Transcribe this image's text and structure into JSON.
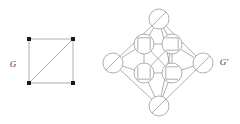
{
  "figure": {
    "kind": "graph-diagram",
    "width": 240,
    "height": 124,
    "background": "#ffffff",
    "edge_color": "#8c8c8c",
    "node_outline_color": "#8c8c8c",
    "node_fill": "#ffffff",
    "vertex_marker_color": "#1a1a1a",
    "label_color": "#3a3a3a"
  },
  "graphs": [
    {
      "id": "G",
      "label": "G",
      "label_position": "left",
      "label_point": {
        "x": 13,
        "y": 65
      },
      "node_style": "filled-square-marker",
      "marker_size": 4,
      "vertices": [
        {
          "id": "a",
          "x": 29,
          "y": 39
        },
        {
          "id": "b",
          "x": 73,
          "y": 39
        },
        {
          "id": "c",
          "x": 29,
          "y": 83
        },
        {
          "id": "d",
          "x": 73,
          "y": 83
        }
      ],
      "edges": [
        {
          "from": "a",
          "to": "b"
        },
        {
          "from": "b",
          "to": "d"
        },
        {
          "from": "d",
          "to": "c"
        },
        {
          "from": "c",
          "to": "a"
        },
        {
          "from": "c",
          "to": "b"
        }
      ]
    },
    {
      "id": "Gprime",
      "label": "G'",
      "label_position": "right",
      "label_point": {
        "x": 224,
        "y": 63
      },
      "node_style": "circle-with-glyph",
      "node_radius": 10,
      "vertices": [
        {
          "id": "top",
          "x": 159,
          "y": 19,
          "glyph": "diagonal-slash",
          "glyph_name": "slash-glyph"
        },
        {
          "id": "left",
          "x": 113,
          "y": 63,
          "glyph": "diagonal-slash",
          "glyph_name": "slash-glyph"
        },
        {
          "id": "right",
          "x": 203,
          "y": 63,
          "glyph": "diagonal-slash",
          "glyph_name": "slash-glyph"
        },
        {
          "id": "bottom",
          "x": 159,
          "y": 106,
          "glyph": "diagonal-slash",
          "glyph_name": "slash-glyph"
        },
        {
          "id": "in_tl",
          "x": 144,
          "y": 44,
          "glyph": "square-open-bottom",
          "glyph_name": "open-bottom-square-glyph"
        },
        {
          "id": "in_tr",
          "x": 172,
          "y": 44,
          "glyph": "square-open-left",
          "glyph_name": "open-left-square-glyph"
        },
        {
          "id": "in_bl",
          "x": 144,
          "y": 73,
          "glyph": "square-open-top",
          "glyph_name": "open-top-square-glyph"
        },
        {
          "id": "in_br",
          "x": 172,
          "y": 73,
          "glyph": "square-open-right",
          "glyph_name": "open-right-square-glyph"
        }
      ],
      "edges": [
        {
          "from": "top",
          "to": "left"
        },
        {
          "from": "top",
          "to": "right"
        },
        {
          "from": "bottom",
          "to": "left"
        },
        {
          "from": "bottom",
          "to": "right"
        },
        {
          "from": "top",
          "to": "in_tl"
        },
        {
          "from": "top",
          "to": "in_tr"
        },
        {
          "from": "bottom",
          "to": "in_bl"
        },
        {
          "from": "bottom",
          "to": "in_br"
        },
        {
          "from": "left",
          "to": "in_tl"
        },
        {
          "from": "left",
          "to": "in_bl"
        },
        {
          "from": "right",
          "to": "in_tr"
        },
        {
          "from": "right",
          "to": "in_br"
        },
        {
          "from": "in_tl",
          "to": "in_tr"
        },
        {
          "from": "in_bl",
          "to": "in_br"
        },
        {
          "from": "in_tl",
          "to": "in_bl"
        },
        {
          "from": "in_tr",
          "to": "in_br"
        },
        {
          "from": "in_tl",
          "to": "in_br"
        },
        {
          "from": "in_tr",
          "to": "in_bl"
        },
        {
          "from": "top",
          "to": "in_br"
        },
        {
          "from": "bottom",
          "to": "in_tr"
        }
      ]
    }
  ]
}
